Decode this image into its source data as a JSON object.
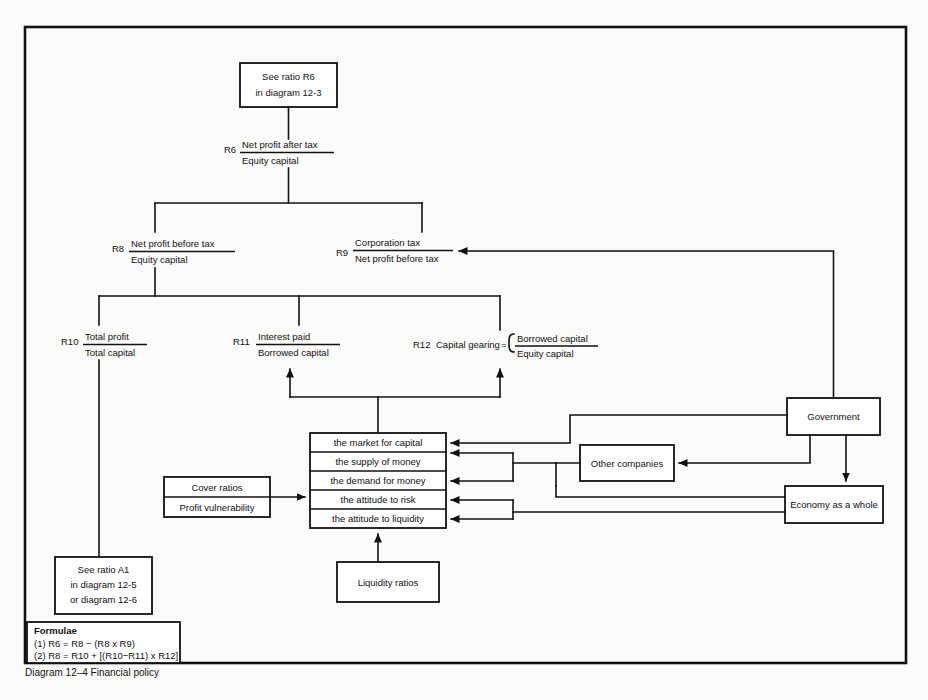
{
  "caption": {
    "number": "Diagram 12–4",
    "title": "Financial policy",
    "full": "Diagram 12–4    Financial policy"
  },
  "top_box": {
    "line1": "See ratio R6",
    "line2": "in diagram 12-3"
  },
  "ratios": [
    {
      "id": "R6",
      "label": "R6",
      "numerator": "Net profit after tax",
      "denominator": "Equity capital"
    },
    {
      "id": "R8",
      "label": "R8",
      "numerator": "Net profit before tax",
      "denominator": "Equity capital"
    },
    {
      "id": "R9",
      "label": "R9",
      "numerator": "Corporation tax",
      "denominator": "Net profit before tax"
    },
    {
      "id": "R10",
      "label": "R10",
      "numerator": "Total profit",
      "denominator": "Total capital"
    },
    {
      "id": "R11",
      "label": "R11",
      "numerator": "Interest paid",
      "denominator": "Borrowed capital"
    },
    {
      "id": "R12",
      "label": "R12",
      "name": "Capital gearing",
      "equals": "=",
      "numerator": "Borrowed capital",
      "denominator": "Equity capital"
    }
  ],
  "factor_stack": {
    "rows": [
      "the market for capital",
      "the supply of money",
      "the demand for money",
      "the attitude to risk",
      "the attitude to liquidity"
    ]
  },
  "cover_box": {
    "rows": [
      "Cover ratios",
      "Profit vulnerability"
    ]
  },
  "liquidity_box": {
    "label": "Liquidity ratios"
  },
  "see_ratio_a1_box": {
    "line1": "See ratio A1",
    "line2": "in diagram 12-5",
    "line3": "or diagram 12-6"
  },
  "external_boxes": [
    {
      "id": "government",
      "label": "Government"
    },
    {
      "id": "other-companies",
      "label": "Other companies"
    },
    {
      "id": "economy",
      "label": "Economy as a whole"
    }
  ],
  "formulae_box": {
    "heading": "Formulae",
    "lines": [
      "(1)  R6 = R8 − (R8 x R9)",
      "(2)  R8 = R10 + [(R10−R11) x R12]"
    ]
  },
  "colors": {
    "ink": "#111111",
    "paper": "#fbfbf9",
    "box_fill": "#ffffff"
  }
}
